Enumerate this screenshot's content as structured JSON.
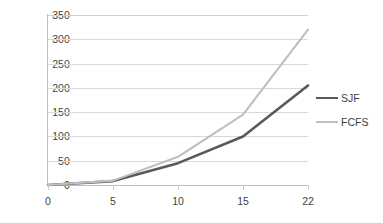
{
  "chart_data": {
    "type": "line",
    "title": "",
    "subtitle": "",
    "xlabel": "",
    "ylabel": "",
    "categories": [
      "0",
      "5",
      "10",
      "15",
      "22"
    ],
    "x": [
      0,
      5,
      10,
      15,
      22
    ],
    "series": [
      {
        "name": "SJF",
        "values": [
          0,
          8,
          45,
          100,
          205
        ],
        "color": "#595959",
        "width": 2.6
      },
      {
        "name": "FCFS",
        "values": [
          0,
          9,
          58,
          145,
          320
        ],
        "color": "#bfbfbf",
        "width": 2.1
      }
    ],
    "ylim": [
      0,
      350
    ],
    "ytick_values": [
      0,
      50,
      100,
      150,
      200,
      250,
      300,
      350
    ],
    "ytick_labels": [
      "0",
      "50",
      "100",
      "150",
      "200",
      "250",
      "300",
      "350"
    ],
    "grid": "horizontal",
    "legend_position": "right",
    "background": "#ffffff",
    "gridline_color": "#d9d9d9",
    "axis_color": "#bfbfbf",
    "text_color": "#3f3f3f"
  },
  "legend": {
    "items": [
      {
        "label": "SJF",
        "color": "#595959",
        "thickness": "2.6px"
      },
      {
        "label": "FCFS",
        "color": "#bfbfbf",
        "thickness": "2.1px"
      }
    ]
  }
}
